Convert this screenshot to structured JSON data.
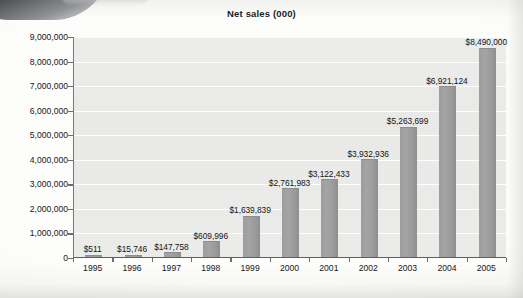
{
  "chart_data": {
    "type": "bar",
    "title": "Net sales (000)",
    "xlabel": "",
    "ylabel": "",
    "categories": [
      "1995",
      "1996",
      "1997",
      "1998",
      "1999",
      "2000",
      "2001",
      "2002",
      "2003",
      "2004",
      "2005"
    ],
    "values": [
      511,
      15746,
      147758,
      609996,
      1639839,
      2761983,
      3122433,
      3932936,
      5263699,
      6921124,
      8490000
    ],
    "value_labels": [
      "$511",
      "$15,746",
      "$147,758",
      "$609,996",
      "$1,639,839",
      "$2,761,983",
      "$3,122,433",
      "$3,932,936",
      "$5,263,699",
      "$6,921,124",
      "$8,490,000"
    ],
    "ylim": [
      0,
      9000000
    ],
    "yticks": [
      0,
      1000000,
      2000000,
      3000000,
      4000000,
      5000000,
      6000000,
      7000000,
      8000000,
      9000000
    ],
    "ytick_labels": [
      "0",
      "1,000,000",
      "2,000,000",
      "3,000,000",
      "4,000,000",
      "5,000,000",
      "6,000,000",
      "7,000,000",
      "8,000,000",
      "9,000,000"
    ],
    "grid": true,
    "grid_axis": "y",
    "legend": false,
    "legend_position": "none",
    "series": [
      {
        "name": "Net sales (000)",
        "values": [
          511,
          15746,
          147758,
          609996,
          1639839,
          2761983,
          3122433,
          3932936,
          5263699,
          6921124,
          8490000
        ]
      }
    ],
    "colors": {
      "bar": "#9a9a9a",
      "plot_background": "#eaeaea",
      "gridline": "#ffffff",
      "axis": "#6b6c6f",
      "text": "#17171a",
      "page_background": "#fbfbfa"
    }
  }
}
